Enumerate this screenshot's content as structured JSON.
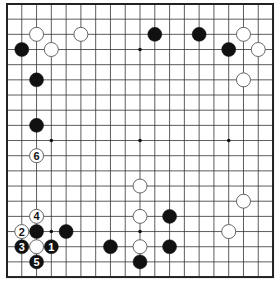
{
  "board": {
    "size": 19,
    "origin_x": 7,
    "origin_y": 4,
    "spacing_x": 14.78,
    "spacing_y": 15.17,
    "stone_radius": 7,
    "colors": {
      "line": "#333333",
      "border": "#222222",
      "black_stone": "#111111",
      "white_stone": "#ffffff",
      "white_stroke": "#555555",
      "label_on_black": "#ffffff",
      "label_on_white": "#111111"
    },
    "star_points": [
      {
        "col": 3,
        "row": 3
      },
      {
        "col": 9,
        "row": 3
      },
      {
        "col": 15,
        "row": 3
      },
      {
        "col": 3,
        "row": 9
      },
      {
        "col": 9,
        "row": 9
      },
      {
        "col": 15,
        "row": 9
      },
      {
        "col": 3,
        "row": 15
      },
      {
        "col": 9,
        "row": 15
      },
      {
        "col": 15,
        "row": 15
      }
    ],
    "stones": [
      {
        "color": "white",
        "col": 2,
        "row": 2,
        "label": ""
      },
      {
        "color": "white",
        "col": 5,
        "row": 2,
        "label": ""
      },
      {
        "color": "black",
        "col": 1,
        "row": 3,
        "label": ""
      },
      {
        "color": "white",
        "col": 3,
        "row": 3,
        "label": ""
      },
      {
        "color": "black",
        "col": 2,
        "row": 5,
        "label": ""
      },
      {
        "color": "black",
        "col": 2,
        "row": 8,
        "label": ""
      },
      {
        "color": "black",
        "col": 10,
        "row": 2,
        "label": ""
      },
      {
        "color": "black",
        "col": 13,
        "row": 2,
        "label": ""
      },
      {
        "color": "white",
        "col": 16,
        "row": 2,
        "label": ""
      },
      {
        "color": "black",
        "col": 15,
        "row": 3,
        "label": ""
      },
      {
        "color": "white",
        "col": 17,
        "row": 3,
        "label": ""
      },
      {
        "color": "white",
        "col": 16,
        "row": 5,
        "label": ""
      },
      {
        "color": "white",
        "col": 2,
        "row": 10,
        "label": "6"
      },
      {
        "color": "white",
        "col": 9,
        "row": 12,
        "label": ""
      },
      {
        "color": "white",
        "col": 16,
        "row": 13,
        "label": ""
      },
      {
        "color": "white",
        "col": 2,
        "row": 14,
        "label": "4"
      },
      {
        "color": "white",
        "col": 9,
        "row": 14,
        "label": ""
      },
      {
        "color": "black",
        "col": 11,
        "row": 14,
        "label": ""
      },
      {
        "color": "white",
        "col": 1,
        "row": 15,
        "label": "2"
      },
      {
        "color": "black",
        "col": 2,
        "row": 15,
        "label": ""
      },
      {
        "color": "black",
        "col": 4,
        "row": 15,
        "label": ""
      },
      {
        "color": "white",
        "col": 15,
        "row": 15,
        "label": ""
      },
      {
        "color": "black",
        "col": 1,
        "row": 16,
        "label": "3"
      },
      {
        "color": "white",
        "col": 2,
        "row": 16,
        "label": ""
      },
      {
        "color": "black",
        "col": 3,
        "row": 16,
        "label": "1"
      },
      {
        "color": "black",
        "col": 7,
        "row": 16,
        "label": ""
      },
      {
        "color": "white",
        "col": 9,
        "row": 16,
        "label": ""
      },
      {
        "color": "black",
        "col": 11,
        "row": 16,
        "label": ""
      },
      {
        "color": "black",
        "col": 2,
        "row": 17,
        "label": "5"
      },
      {
        "color": "black",
        "col": 9,
        "row": 17,
        "label": ""
      }
    ]
  }
}
